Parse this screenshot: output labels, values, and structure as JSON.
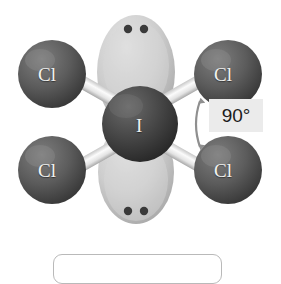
{
  "figure": {
    "background_color": "#ffffff"
  },
  "molecule": {
    "formula_center_atom": "I",
    "geometry": "square planar",
    "central_atom": {
      "label": "I",
      "name": "iodine",
      "color": "#4a4a4a",
      "cx": 140,
      "cy": 124,
      "r": 37
    },
    "ligands": [
      {
        "label": "Cl",
        "name": "chlorine-top-left",
        "color": "#606060",
        "cx": 52,
        "cy": 74,
        "r": 34
      },
      {
        "label": "Cl",
        "name": "chlorine-top-right",
        "color": "#606060",
        "cx": 228,
        "cy": 74,
        "r": 34
      },
      {
        "label": "Cl",
        "name": "chlorine-bottom-left",
        "color": "#606060",
        "cx": 52,
        "cy": 170,
        "r": 34
      },
      {
        "label": "Cl",
        "name": "chlorine-bottom-right",
        "color": "#606060",
        "cx": 228,
        "cy": 170,
        "r": 34
      }
    ],
    "bonds": [
      {
        "name": "bond-i-cl-top-left",
        "color": "#ededed"
      },
      {
        "name": "bond-i-cl-top-right",
        "color": "#ededed"
      },
      {
        "name": "bond-i-cl-bottom-left",
        "color": "#ededed"
      },
      {
        "name": "bond-i-cl-bottom-right",
        "color": "#ededed"
      }
    ],
    "lone_pairs": [
      {
        "name": "lone-pair-top",
        "lobe_color": "#cccccc",
        "dot_color": "#3a3a3a",
        "dots": [
          {
            "cx": 128,
            "cy": 29,
            "r": 4
          },
          {
            "cx": 144,
            "cy": 29,
            "r": 4
          }
        ]
      },
      {
        "name": "lone-pair-bottom",
        "lobe_color": "#cccccc",
        "dot_color": "#3a3a3a",
        "dots": [
          {
            "cx": 128,
            "cy": 211,
            "r": 4
          },
          {
            "cx": 144,
            "cy": 211,
            "r": 4
          }
        ]
      }
    ]
  },
  "annotation": {
    "angle_label": "90°",
    "angle_badge_color": "#ebebeb",
    "angle_text_color": "#1c1c1c",
    "arrow_color": "#8c8c8c",
    "arrow_name": "bond-angle-double-arrow"
  },
  "bottom_panel": {
    "name": "caption-panel",
    "border_color": "#b9b9b9",
    "text": ""
  }
}
